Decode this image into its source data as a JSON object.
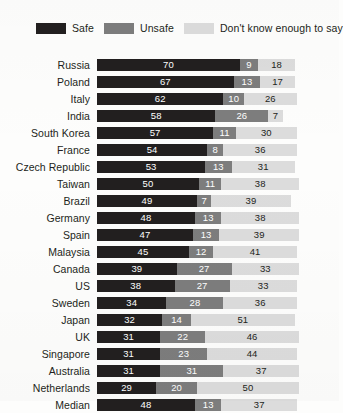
{
  "legend": {
    "items": [
      {
        "label": "Safe",
        "color": "#221f1f",
        "icon": "legend-swatch-safe"
      },
      {
        "label": "Unsafe",
        "color": "#7d7d7d",
        "icon": "legend-swatch-unsafe"
      },
      {
        "label": "Don't know enough to say",
        "color": "#dcdcdc",
        "icon": "legend-swatch-dont-know"
      }
    ]
  },
  "chart_data": {
    "type": "bar",
    "subtype": "stacked-horizontal-100",
    "title": "",
    "subtitle": "",
    "xlabel": "",
    "ylabel": "",
    "xlim": [
      0,
      100
    ],
    "grid": false,
    "legend_position": "top-left",
    "categories": [
      "Russia",
      "Poland",
      "Italy",
      "India",
      "South Korea",
      "France",
      "Czech Republic",
      "Taiwan",
      "Brazil",
      "Germany",
      "Spain",
      "Malaysia",
      "Canada",
      "US",
      "Sweden",
      "Japan",
      "UK",
      "Singapore",
      "Australia",
      "Netherlands",
      "Median"
    ],
    "series": [
      {
        "name": "Safe",
        "color": "#221f1f",
        "values": [
          70,
          67,
          62,
          58,
          57,
          54,
          53,
          50,
          49,
          48,
          47,
          45,
          39,
          38,
          34,
          32,
          31,
          31,
          31,
          29,
          48
        ]
      },
      {
        "name": "Unsafe",
        "color": "#7d7d7d",
        "values": [
          9,
          13,
          10,
          26,
          11,
          8,
          13,
          11,
          7,
          13,
          13,
          12,
          27,
          27,
          28,
          14,
          22,
          23,
          31,
          20,
          13
        ]
      },
      {
        "name": "Don't know enough to say",
        "color": "#dcdcdc",
        "values": [
          18,
          17,
          26,
          7,
          30,
          36,
          31,
          38,
          39,
          38,
          39,
          41,
          33,
          33,
          36,
          51,
          46,
          44,
          37,
          50,
          37
        ]
      }
    ]
  }
}
